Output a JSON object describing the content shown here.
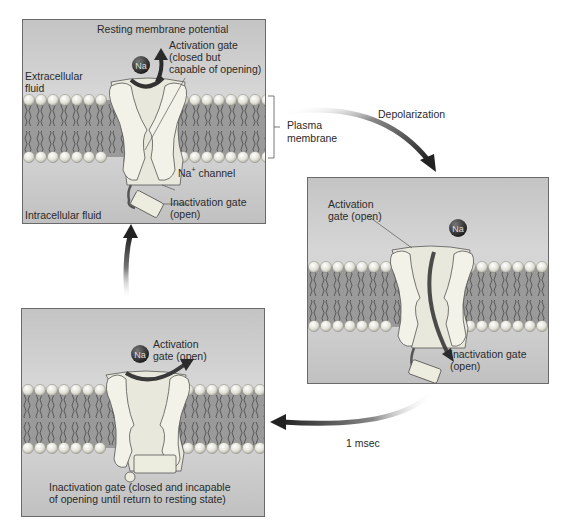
{
  "figure": {
    "colors": {
      "panel_top": "#bdbdbd",
      "panel_mid": "#d9d9d9",
      "membrane_band": "#8f8f8f",
      "lipid_head": "#e6e6de",
      "channel_fill": "#ececdf",
      "channel_stroke": "#555555",
      "arrow_dark": "#2b2b2b",
      "ion_fill": "#2a2a2a"
    }
  },
  "panels": {
    "resting": {
      "title": "Resting membrane potential",
      "extracellular": "Extracellular\nfluid",
      "extracellular_line1": "Extracellular",
      "extracellular_line2": "fluid",
      "activation_line1": "Activation gate",
      "activation_line2": "(closed but",
      "activation_line3": "capable of opening)",
      "channel_label": "Na",
      "channel_label_sup": "+",
      "channel_label_rest": " channel",
      "inactivation_line1": "Inactivation gate",
      "inactivation_line2": "(open)",
      "intracellular": "Intracellular fluid",
      "ion": "Na"
    },
    "depolarized": {
      "activation_line1": "Activation",
      "activation_line2": "gate (open)",
      "inactivation_line1": "Inactivation gate",
      "inactivation_line2": "(open)",
      "ion": "Na"
    },
    "inactivated": {
      "activation_line1": "Activation",
      "activation_line2": "gate (open)",
      "inactivation_line1": "Inactivation gate (closed and incapable",
      "inactivation_line2": "of opening until return to resting state)",
      "ion": "Na"
    }
  },
  "annotations": {
    "plasma_membrane_line1": "Plasma",
    "plasma_membrane_line2": "membrane",
    "depolarization": "Depolarization",
    "time": "1 msec"
  }
}
